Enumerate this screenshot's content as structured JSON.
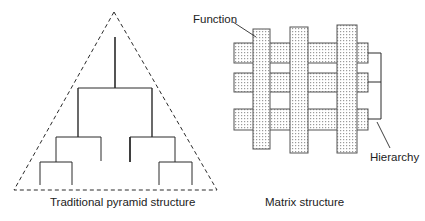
{
  "diagrams": {
    "pyramid": {
      "caption": "Traditional pyramid structure",
      "shape": "dashed triangle enclosing a tree (org chart)",
      "tree_levels": 4
    },
    "matrix": {
      "caption": "Matrix structure",
      "labels": {
        "function": "Function",
        "hierarchy": "Hierarchy"
      },
      "horizontal_bars": 3,
      "vertical_bars": 3
    }
  },
  "colors": {
    "line": "#2a2a2a",
    "bar_border": "#555555",
    "bar_fill_dot": "#9a9a9a",
    "background": "#ffffff"
  }
}
